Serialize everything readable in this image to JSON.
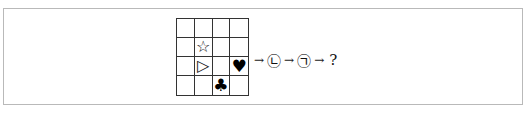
{
  "puzzle": {
    "grid": {
      "rows": 4,
      "cols": 4,
      "cells": [
        [
          "",
          "",
          "",
          ""
        ],
        [
          "",
          "☆",
          "",
          ""
        ],
        [
          "",
          "▷",
          "",
          "♥"
        ],
        [
          "",
          "",
          "♣",
          ""
        ]
      ],
      "symbols": [
        {
          "name": "star-outline",
          "glyph": "☆",
          "row": 1,
          "col": 1
        },
        {
          "name": "triangle-right-outline",
          "glyph": "▷",
          "row": 2,
          "col": 1
        },
        {
          "name": "heart-filled",
          "glyph": "♥",
          "row": 2,
          "col": 3
        },
        {
          "name": "club-filled",
          "glyph": "♣",
          "row": 3,
          "col": 2
        }
      ]
    },
    "sequence": {
      "arrow": "→",
      "step1": "㉡",
      "step2": "㉠",
      "result": "?"
    }
  }
}
